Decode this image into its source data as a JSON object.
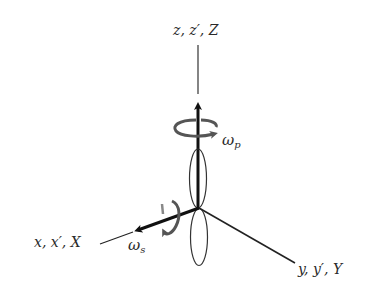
{
  "diagram": {
    "axes": {
      "z": {
        "label": "z, z′, Z"
      },
      "x": {
        "label": "x, x′, X"
      },
      "y": {
        "label": "y, y′, Y"
      }
    },
    "rotations": {
      "precession": {
        "symbol": "ω",
        "subscript": "p"
      },
      "spin": {
        "symbol": "ω",
        "subscript": "s"
      }
    },
    "colors": {
      "line": "#1a1a1a",
      "arrow_curl": "#555555",
      "lobe": "#333333"
    }
  }
}
